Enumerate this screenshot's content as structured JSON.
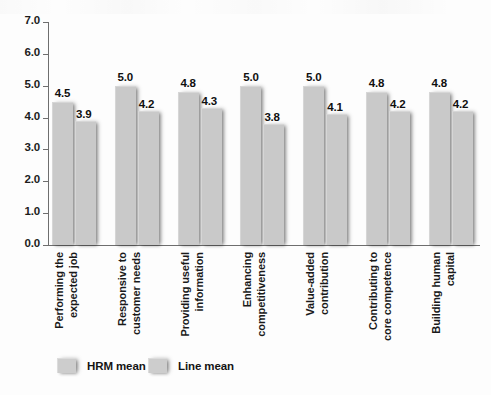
{
  "chart_data": {
    "type": "bar",
    "title": "",
    "xlabel": "",
    "ylabel": "",
    "ylim": [
      0.0,
      7.0
    ],
    "ytick_labels": [
      "0.0",
      "1.0",
      "2.0",
      "3.0",
      "4.0",
      "5.0",
      "6.0",
      "7.0"
    ],
    "ytick_values": [
      0.0,
      1.0,
      2.0,
      3.0,
      4.0,
      5.0,
      6.0,
      7.0
    ],
    "grid": false,
    "legend_position": "bottom-left",
    "categories": [
      "Performing the\nexpected job",
      "Responsive to\ncustomer needs",
      "Providing useful\ninformation",
      "Enhancing\ncompetitiveness",
      "Value-added\ncontribution",
      "Contributing to\ncore competence",
      "Building human\ncapital"
    ],
    "series": [
      {
        "name": "HRM mean",
        "values": [
          4.5,
          5.0,
          4.8,
          5.0,
          5.0,
          4.8,
          4.8
        ],
        "labels": [
          "4.5",
          "5.0",
          "4.8",
          "5.0",
          "5.0",
          "4.8",
          "4.8"
        ],
        "color": "#c9c9c9"
      },
      {
        "name": "Line mean",
        "values": [
          3.9,
          4.2,
          4.3,
          3.8,
          4.1,
          4.2,
          4.2
        ],
        "labels": [
          "3.9",
          "4.2",
          "4.3",
          "3.8",
          "4.1",
          "4.2",
          "4.2"
        ],
        "color": "#c9c9c9"
      }
    ]
  },
  "legend": {
    "items": [
      {
        "label": "HRM mean"
      },
      {
        "label": "Line mean"
      }
    ]
  }
}
